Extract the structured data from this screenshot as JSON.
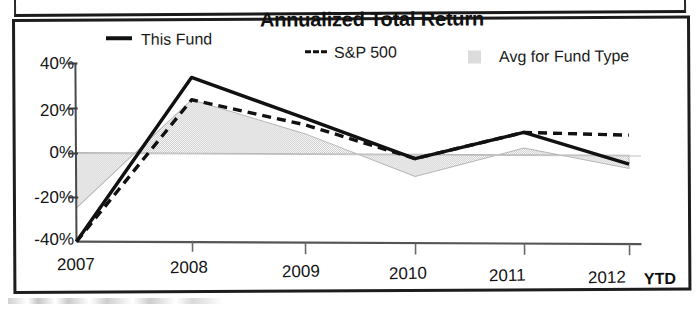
{
  "frame": {
    "accent_color": "#1d1d1d",
    "background": "#ffffff"
  },
  "chart_data": {
    "type": "line",
    "title": "Annualized Total Return",
    "xlabel": "",
    "ylabel": "",
    "categories": [
      "2007",
      "2008",
      "2009",
      "2010",
      "2011",
      "2012"
    ],
    "x_tick_labels": [
      "2007",
      "2008",
      "2009",
      "2010",
      "2011",
      "2012"
    ],
    "x_axis_suffix": "YTD",
    "y_tick_labels": [
      "40%",
      "20%",
      "0%",
      "-20%",
      "-40%"
    ],
    "y_tick_values": [
      40,
      20,
      0,
      -20,
      -40
    ],
    "ylim": [
      -42,
      42
    ],
    "grid": false,
    "legend_position": "top",
    "series": [
      {
        "name": "This Fund",
        "style": "solid",
        "color": "#111111",
        "values": [
          -40,
          34,
          16,
          -2,
          10,
          -4
        ]
      },
      {
        "name": "S&P 500",
        "style": "dashed",
        "color": "#111111",
        "values": [
          -40,
          24,
          13,
          -2,
          10,
          9
        ]
      },
      {
        "name": "Avg for Fund Type",
        "style": "area",
        "color": "#dcdcdc",
        "values": [
          -25,
          24,
          9,
          -10,
          3,
          -6
        ]
      }
    ],
    "legend": [
      {
        "label": "This Fund",
        "marker": "solid-line",
        "color": "#111111"
      },
      {
        "label": "S&P 500",
        "marker": "dashed-line",
        "prefix": "---",
        "color": "#111111"
      },
      {
        "label": "Avg for Fund Type",
        "marker": "filled-square",
        "color": "#dcdcdc"
      }
    ]
  }
}
